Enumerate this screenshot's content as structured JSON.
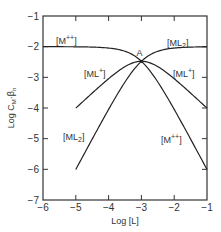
{
  "chart_data": {
    "type": "line",
    "title": "",
    "xlabel": "Log [L]",
    "ylabel": "Log C_M·β_n",
    "xlim": [
      -6,
      -1
    ],
    "ylim": [
      -7,
      -1
    ],
    "x_ticks": [
      -6,
      -5,
      -4,
      -3,
      -2,
      -1
    ],
    "y_ticks": [
      -1,
      -2,
      -3,
      -4,
      -5,
      -6,
      -7
    ],
    "grid": false,
    "legend": "inline labels",
    "annotations": [
      {
        "text": "A",
        "x": -3,
        "y": -2.5
      }
    ],
    "series": [
      {
        "name": "[M++]",
        "x": [
          -6,
          -5,
          -4,
          -3.5,
          -3,
          -2.5,
          -2,
          -1.5,
          -1
        ],
        "values": [
          -2.0,
          -2.0,
          -2.04,
          -2.17,
          -2.48,
          -3.02,
          -3.96,
          -4.98,
          -6.0
        ]
      },
      {
        "name": "[ML+]",
        "x": [
          -5,
          -4.5,
          -4,
          -3.5,
          -3,
          -2.5,
          -2,
          -1.5,
          -1
        ],
        "values": [
          -4.0,
          -3.51,
          -3.04,
          -2.67,
          -2.48,
          -2.52,
          -2.96,
          -3.48,
          -4.0
        ]
      },
      {
        "name": "[ML2]",
        "x": [
          -5,
          -4.5,
          -4,
          -3.5,
          -3,
          -2.5,
          -2,
          -1.5,
          -1
        ],
        "values": [
          -6.0,
          -5.01,
          -4.04,
          -3.17,
          -2.48,
          -2.02,
          -1.96,
          -1.98,
          -2.0
        ]
      }
    ],
    "labels": [
      {
        "text": "[M++]",
        "near": "upper-left"
      },
      {
        "text": "[ML2]",
        "near": "upper-right"
      },
      {
        "text": "[ML+]",
        "near": "left-middle"
      },
      {
        "text": "[ML+]",
        "near": "right-middle"
      },
      {
        "text": "[ML2]",
        "near": "lower-left"
      },
      {
        "text": "[M++]",
        "near": "lower-right"
      }
    ]
  },
  "text": {
    "xlabel": "Log [L]",
    "ylabel_main": "Log C",
    "ylabel_sub": "M",
    "ylabel_tail": "·β",
    "ylabel_tail_sub": "n",
    "point_a": "A",
    "label_m_top": "[M",
    "label_m_sup": "++",
    "label_ml2_top": "[ML",
    "label_ml2_sub": "2",
    "label_mlp_left": "[ML",
    "label_mlp_sup": "+",
    "label_close": "]"
  }
}
